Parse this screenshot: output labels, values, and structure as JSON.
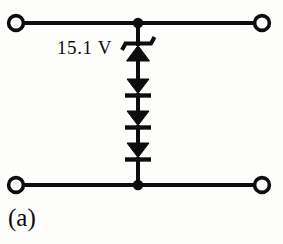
{
  "figure": {
    "caption": "(a)",
    "background_color": "#fdfdfc",
    "ink_color": "#0d0d0d",
    "width": 283,
    "height": 244
  },
  "labels": {
    "zener_voltage": "15.1 V"
  },
  "circuit": {
    "type": "diode-clipper-network",
    "description": "Two-port network: a Zener diode in series with three forward diodes bridging the top and bottom rails",
    "rails": {
      "top": {
        "y": 23,
        "x_start": 16,
        "x_end": 262
      },
      "bottom": {
        "y": 185,
        "x_start": 16,
        "x_end": 262
      }
    },
    "terminals": [
      {
        "name": "top-left-terminal",
        "x": 16,
        "y": 23,
        "radius": 7.5
      },
      {
        "name": "top-right-terminal",
        "x": 262,
        "y": 23,
        "radius": 7.5
      },
      {
        "name": "bottom-left-terminal",
        "x": 16,
        "y": 185,
        "radius": 7.5
      },
      {
        "name": "bottom-right-terminal",
        "x": 262,
        "y": 185,
        "radius": 7.5
      }
    ],
    "junctions": [
      {
        "name": "top-node",
        "x": 138,
        "y": 23,
        "radius": 5
      },
      {
        "name": "bottom-node",
        "x": 138,
        "y": 185,
        "radius": 5
      }
    ],
    "branch_x": 138,
    "components": [
      {
        "name": "zener-diode",
        "kind": "zener",
        "orientation": "anode-down",
        "bar_y": 44,
        "triangle_top_y": 45,
        "triangle_bottom_y": 61,
        "half_width": 11,
        "label": "15.1 V"
      },
      {
        "name": "diode-1",
        "kind": "diode",
        "orientation": "anode-up",
        "triangle_top_y": 78,
        "triangle_bottom_y": 93,
        "bar_y": 95,
        "half_width": 11
      },
      {
        "name": "diode-2",
        "kind": "diode",
        "orientation": "anode-up",
        "triangle_top_y": 110,
        "triangle_bottom_y": 125,
        "bar_y": 127,
        "half_width": 11
      },
      {
        "name": "diode-3",
        "kind": "diode",
        "orientation": "anode-up",
        "triangle_top_y": 142,
        "triangle_bottom_y": 157,
        "bar_y": 159,
        "half_width": 11
      }
    ]
  }
}
